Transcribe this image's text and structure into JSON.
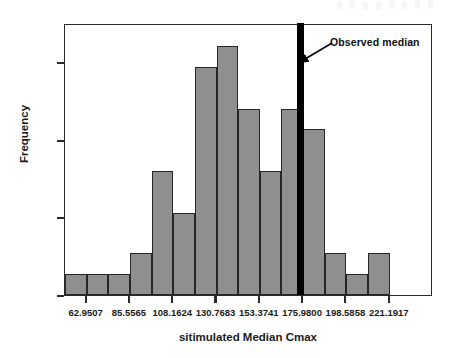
{
  "chart_data": {
    "type": "bar",
    "title": "",
    "subtitle": "",
    "xlabel": "sitimulated Median Cmax",
    "ylabel": "Frequency",
    "grid": false,
    "legend": null,
    "xlim": [
      51.6478,
      243.7975
    ],
    "ylim": [
      0.0,
      0.175
    ],
    "bin_width": 11.30295,
    "x_tick_labels": [
      "62.9507",
      "85.5565",
      "108.1624",
      "130.7683",
      "153.3741",
      "175.9800",
      "198.5858",
      "221.1917"
    ],
    "x_tick_values": [
      62.9507,
      85.5565,
      108.1624,
      130.7683,
      153.3741,
      175.98,
      198.5858,
      221.1917
    ],
    "y_tick_labels": [
      "0.00",
      "0.05",
      "0.10",
      "0.15"
    ],
    "y_tick_values": [
      0.0,
      0.05,
      0.1,
      0.15
    ],
    "categories": [
      "57.30",
      "68.60",
      "79.90",
      "91.21",
      "102.51",
      "113.81",
      "125.12",
      "136.42",
      "147.72",
      "159.03",
      "170.33",
      "181.63",
      "192.94",
      "204.24",
      "215.54",
      "226.85"
    ],
    "bin_centers": [
      57.2992,
      68.6022,
      79.9051,
      91.2081,
      102.511,
      113.814,
      125.1169,
      136.4199,
      147.7228,
      159.0258,
      170.3287,
      181.6317,
      192.9346,
      204.2376,
      215.5405,
      226.8435
    ],
    "values": [
      0.0135,
      0.0135,
      0.0135,
      0.027,
      0.08,
      0.0525,
      0.147,
      0.1605,
      0.12,
      0.08,
      0.12,
      0.1065,
      0.027,
      0.0135,
      0.027,
      0.0
    ],
    "annotations": [
      {
        "id": "observed-median",
        "label": "Observed median",
        "kind": "vertical-line",
        "x_value": 174.5,
        "color": "#000000"
      }
    ]
  },
  "figure": {
    "axis_color": "#2b2b2b",
    "bar_fill": "#8f8f8f",
    "bar_edge": "#262626",
    "median_color": "#000000",
    "background": "#ffffff"
  },
  "labels": {
    "y_axis_title": "Frequency",
    "x_axis_title": "sitimulated Median Cmax",
    "observed_median": "Observed median"
  }
}
